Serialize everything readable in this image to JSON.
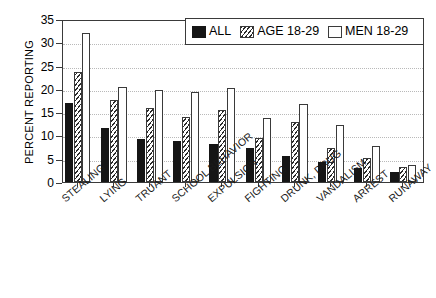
{
  "chart_data": {
    "type": "bar",
    "title": "",
    "xlabel": "",
    "ylabel": "PERCENT REPORTING",
    "ylim": [
      0,
      35
    ],
    "yticks": [
      0,
      5,
      10,
      15,
      20,
      25,
      30,
      35
    ],
    "grid": true,
    "legend_position": "top-right",
    "categories": [
      "STEALING",
      "LYING",
      "TRUANT",
      "SCHOOL BEHAVIOR",
      "EXPULSION",
      "FIGHTING",
      "DRUNK, DRUG",
      "VANDALISM",
      "ARREST",
      "RUNAWAY"
    ],
    "series": [
      {
        "name": "ALL",
        "style": "solid-black",
        "values": [
          16.9,
          11.6,
          9.3,
          8.7,
          8.2,
          7.2,
          5.6,
          4.3,
          3.1,
          2.1
        ]
      },
      {
        "name": "AGE 18-29",
        "style": "hatched",
        "values": [
          23.6,
          17.7,
          15.9,
          13.9,
          15.4,
          9.5,
          12.8,
          7.3,
          5.2,
          3.2
        ]
      },
      {
        "name": "MEN 18-29",
        "style": "white",
        "values": [
          32.0,
          20.5,
          19.7,
          19.4,
          20.2,
          13.8,
          16.8,
          12.2,
          7.7,
          3.7
        ]
      }
    ]
  },
  "colors": {
    "series_all": "#151515",
    "series_age": "#2b2b2b",
    "series_men": "#ffffff",
    "axis": "#3a3a3a",
    "grid": "#b9b9b9"
  }
}
